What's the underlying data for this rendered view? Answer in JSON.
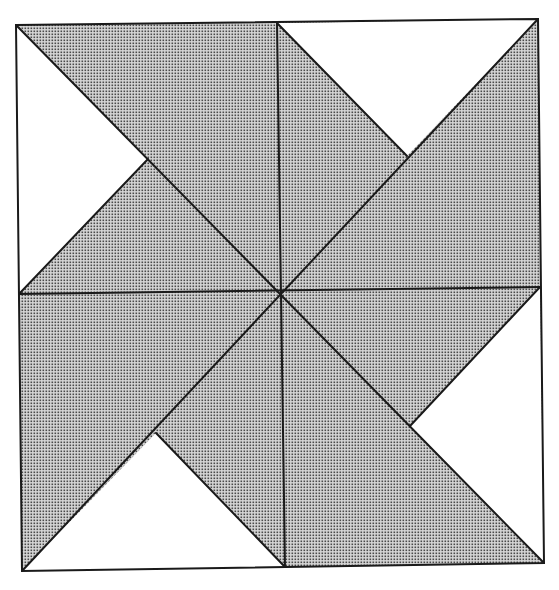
{
  "diagram": {
    "type": "pinwheel-quilt-block",
    "colors": {
      "background": "#ffffff",
      "shade_fill": "#d6d6d6",
      "shade_dot": "#4a4a4a",
      "line": "#1a1a1a",
      "unshaded": "#ffffff"
    },
    "outer_square": {
      "top_left": [
        16,
        25
      ],
      "top_right": [
        538,
        19
      ],
      "bottom_right": [
        544,
        563
      ],
      "bottom_left": [
        22,
        571
      ]
    },
    "edge_midpoints": {
      "top": [
        277,
        23
      ],
      "right": [
        540,
        287
      ],
      "bottom": [
        285,
        567
      ],
      "left": [
        19,
        294
      ]
    },
    "center": [
      281,
      292
    ],
    "notch_vertices": {
      "left": [
        148,
        159
      ],
      "top_right": [
        407,
        156
      ],
      "right": [
        410,
        426
      ],
      "bottom": [
        156,
        433
      ]
    },
    "unshaded_triangles": [
      {
        "name": "top-left-white",
        "points": [
          [
            16,
            25
          ],
          [
            148,
            159
          ],
          [
            19,
            294
          ]
        ]
      },
      {
        "name": "top-right-white",
        "points": [
          [
            277,
            23
          ],
          [
            538,
            19
          ],
          [
            407,
            156
          ]
        ]
      },
      {
        "name": "bottom-right-white",
        "points": [
          [
            540,
            287
          ],
          [
            544,
            563
          ],
          [
            410,
            426
          ]
        ]
      },
      {
        "name": "bottom-left-white",
        "points": [
          [
            22,
            571
          ],
          [
            156,
            433
          ],
          [
            285,
            567
          ]
        ]
      }
    ],
    "lines": [
      {
        "name": "diagonal-tl-br",
        "from": [
          16,
          25
        ],
        "to": [
          544,
          563
        ]
      },
      {
        "name": "diagonal-tr-bl",
        "from": [
          538,
          19
        ],
        "to": [
          22,
          571
        ]
      },
      {
        "name": "vertical-center",
        "from": [
          277,
          23
        ],
        "to": [
          285,
          567
        ]
      },
      {
        "name": "horizontal-center",
        "from": [
          19,
          294
        ],
        "to": [
          540,
          287
        ]
      },
      {
        "name": "notch-left-to-left-mid",
        "from": [
          148,
          159
        ],
        "to": [
          19,
          294
        ]
      },
      {
        "name": "notch-topright-to-top-mid",
        "from": [
          407,
          156
        ],
        "to": [
          277,
          23
        ]
      },
      {
        "name": "notch-right-to-right-mid",
        "from": [
          410,
          426
        ],
        "to": [
          540,
          287
        ]
      },
      {
        "name": "notch-bottom-to-bottom-mid",
        "from": [
          156,
          433
        ],
        "to": [
          285,
          567
        ]
      }
    ]
  }
}
